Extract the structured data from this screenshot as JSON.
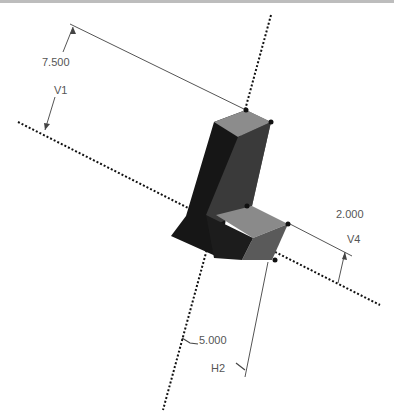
{
  "viewport": {
    "name": "3d-sketch-viewport"
  },
  "model": {
    "name": "L-shaped extrusion",
    "color_top": "#8a8a8a",
    "color_side": "#5a5a5a",
    "color_dark": "#161616"
  },
  "dimensions": [
    {
      "id": "V1",
      "value": "7.500",
      "name_label": "V1"
    },
    {
      "id": "V4",
      "value": "2.000",
      "name_label": "V4"
    },
    {
      "id": "H2",
      "value": "5.000",
      "name_label": "H2"
    }
  ]
}
